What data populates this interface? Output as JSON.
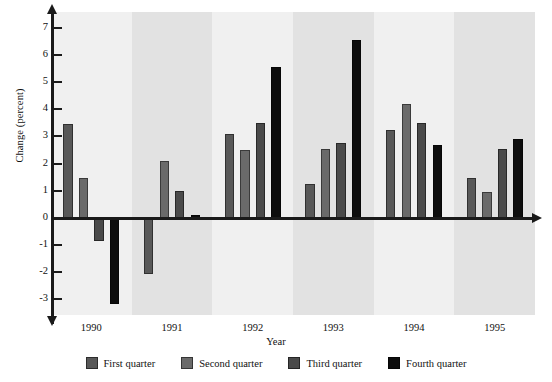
{
  "chart_data": {
    "type": "bar",
    "title": "",
    "xlabel": "Year",
    "ylabel": "Change (percent)",
    "categories": [
      "1990",
      "1991",
      "1992",
      "1993",
      "1994",
      "1995"
    ],
    "ylim": [
      -3.6,
      7.6
    ],
    "yticks": [
      7,
      6,
      5,
      4,
      3,
      2,
      1,
      0,
      -1,
      -2,
      -3
    ],
    "ytick_labels": [
      "7",
      "6",
      "5",
      "4",
      "3",
      "2",
      "1",
      "0",
      "-1",
      "-2",
      "-3"
    ],
    "grid": false,
    "legend_position": "bottom",
    "series": [
      {
        "name": "First quarter",
        "color": "#585858",
        "values": [
          3.45,
          -2.1,
          3.1,
          1.25,
          3.25,
          1.45
        ]
      },
      {
        "name": "Second quarter",
        "color": "#6a6a6a",
        "values": [
          1.45,
          2.1,
          2.5,
          2.55,
          4.2,
          0.95
        ]
      },
      {
        "name": "Third quarter",
        "color": "#4a4a4a",
        "values": [
          -0.85,
          1.0,
          3.5,
          2.75,
          3.5,
          2.55
        ]
      },
      {
        "name": "Fourth quarter",
        "color": "#0d0d0d",
        "values": [
          -3.2,
          0.1,
          5.55,
          6.55,
          2.7,
          2.9
        ]
      }
    ],
    "band_colors": [
      "#f0f0f0",
      "#e2e2e2"
    ],
    "axis_color": "#1a1a1a",
    "background": "#ffffff"
  },
  "legend": {
    "items": [
      {
        "label": "First quarter",
        "color": "#585858"
      },
      {
        "label": "Second quarter",
        "color": "#6a6a6a"
      },
      {
        "label": "Third quarter",
        "color": "#4a4a4a"
      },
      {
        "label": "Fourth quarter",
        "color": "#0d0d0d"
      }
    ]
  }
}
